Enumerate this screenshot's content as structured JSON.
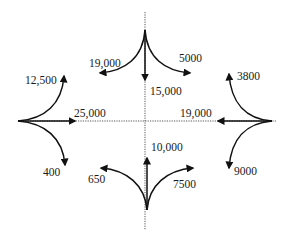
{
  "diagram": {
    "approaches": {
      "north": {
        "through": "15,000",
        "left_turn": "5000",
        "right_turn": "19,000"
      },
      "west": {
        "through": "25,000",
        "left_turn": "12,500",
        "right_turn": "400"
      },
      "east": {
        "through": "19,000",
        "left_turn": "9000",
        "right_turn": "3800"
      },
      "south": {
        "through": "10,000",
        "left_turn": "650",
        "right_turn": "7500"
      }
    },
    "colors": {
      "arrow": "#111111",
      "centerline": "#555555",
      "background": "#ffffff"
    }
  }
}
